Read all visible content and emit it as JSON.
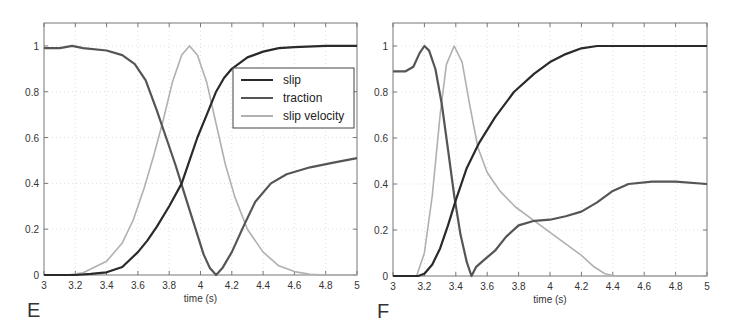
{
  "chart_data": [
    {
      "type": "line",
      "panel_label": "E",
      "xlabel": "time (s)",
      "ylabel": "",
      "xlim": [
        3,
        5
      ],
      "ylim": [
        0,
        1.1
      ],
      "xticks": [
        3,
        3.2,
        3.4,
        3.6,
        3.8,
        4,
        4.2,
        4.4,
        4.6,
        4.8,
        5
      ],
      "xtick_labels": [
        "3",
        "3.2",
        "3.4",
        "3.6",
        "3.8",
        "4",
        "4.2",
        "4.4",
        "4.6",
        "4.8",
        "5"
      ],
      "yticks": [
        0,
        0.2,
        0.4,
        0.6,
        0.8,
        1
      ],
      "ytick_labels": [
        "0",
        "0.2",
        "0.4",
        "0.6",
        "0.8",
        "1"
      ],
      "grid": true,
      "legend": {
        "position": "upper right",
        "entries": [
          "slip",
          "traction",
          "slip velocity"
        ]
      },
      "series": [
        {
          "name": "slip",
          "color": "#2a2a2a",
          "x": [
            3.0,
            3.2,
            3.3,
            3.4,
            3.5,
            3.6,
            3.66,
            3.72,
            3.8,
            3.88,
            3.94,
            3.98,
            4.04,
            4.1,
            4.15,
            4.2,
            4.3,
            4.4,
            4.5,
            4.6,
            4.8,
            5.0
          ],
          "y": [
            0,
            0,
            0.005,
            0.012,
            0.035,
            0.1,
            0.15,
            0.21,
            0.3,
            0.4,
            0.52,
            0.6,
            0.7,
            0.8,
            0.86,
            0.9,
            0.95,
            0.975,
            0.99,
            0.995,
            1.0,
            1.0
          ]
        },
        {
          "name": "traction",
          "color": "#555555",
          "x": [
            3.0,
            3.1,
            3.18,
            3.25,
            3.4,
            3.5,
            3.58,
            3.65,
            3.72,
            3.78,
            3.84,
            3.9,
            3.96,
            4.02,
            4.06,
            4.1,
            4.14,
            4.2,
            4.28,
            4.35,
            4.45,
            4.55,
            4.7,
            4.85,
            5.0
          ],
          "y": [
            0.99,
            0.99,
            1.0,
            0.99,
            0.98,
            0.96,
            0.92,
            0.85,
            0.72,
            0.6,
            0.48,
            0.35,
            0.22,
            0.09,
            0.03,
            0.0,
            0.03,
            0.1,
            0.22,
            0.32,
            0.4,
            0.44,
            0.47,
            0.49,
            0.51
          ]
        },
        {
          "name": "slip velocity",
          "color": "#b0b0b0",
          "x": [
            3.0,
            3.15,
            3.25,
            3.4,
            3.5,
            3.57,
            3.64,
            3.7,
            3.76,
            3.82,
            3.88,
            3.93,
            3.98,
            4.04,
            4.1,
            4.16,
            4.22,
            4.3,
            4.4,
            4.5,
            4.6,
            4.7,
            4.8,
            5.0
          ],
          "y": [
            0,
            0,
            0.01,
            0.06,
            0.14,
            0.24,
            0.38,
            0.52,
            0.67,
            0.84,
            0.96,
            1.0,
            0.96,
            0.84,
            0.66,
            0.48,
            0.34,
            0.2,
            0.1,
            0.04,
            0.015,
            0.003,
            0,
            0
          ]
        }
      ]
    },
    {
      "type": "line",
      "panel_label": "F",
      "xlabel": "time (s)",
      "ylabel": "",
      "xlim": [
        3,
        5
      ],
      "ylim": [
        0,
        1.1
      ],
      "xticks": [
        3,
        3.2,
        3.4,
        3.6,
        3.8,
        4,
        4.2,
        4.4,
        4.6,
        4.8,
        5
      ],
      "xtick_labels": [
        "3",
        "3.2",
        "3.4",
        "3.6",
        "3.8",
        "4",
        "4.2",
        "4.4",
        "4.6",
        "4.8",
        "5"
      ],
      "yticks": [
        0,
        0.2,
        0.4,
        0.6,
        0.8,
        1
      ],
      "ytick_labels": [
        "0",
        "0.2",
        "0.4",
        "0.6",
        "0.8",
        "1"
      ],
      "grid": true,
      "series": [
        {
          "name": "slip",
          "color": "#2a2a2a",
          "x": [
            3.0,
            3.16,
            3.2,
            3.25,
            3.3,
            3.35,
            3.4,
            3.47,
            3.55,
            3.65,
            3.77,
            3.9,
            4.0,
            4.1,
            4.2,
            4.3,
            4.4,
            4.6,
            4.8,
            5.0
          ],
          "y": [
            0,
            0,
            0.01,
            0.05,
            0.12,
            0.22,
            0.33,
            0.47,
            0.58,
            0.69,
            0.8,
            0.88,
            0.93,
            0.965,
            0.99,
            1.0,
            1.0,
            1.0,
            1.0,
            1.0
          ]
        },
        {
          "name": "traction",
          "color": "#555555",
          "x": [
            3.0,
            3.08,
            3.13,
            3.17,
            3.2,
            3.23,
            3.27,
            3.31,
            3.35,
            3.39,
            3.43,
            3.47,
            3.5,
            3.53,
            3.58,
            3.65,
            3.72,
            3.8,
            3.9,
            4.0,
            4.1,
            4.2,
            4.3,
            4.4,
            4.5,
            4.65,
            4.8,
            5.0
          ],
          "y": [
            0.89,
            0.89,
            0.91,
            0.97,
            1.0,
            0.98,
            0.9,
            0.75,
            0.55,
            0.35,
            0.18,
            0.06,
            0.0,
            0.04,
            0.07,
            0.11,
            0.17,
            0.22,
            0.24,
            0.245,
            0.26,
            0.28,
            0.32,
            0.37,
            0.4,
            0.41,
            0.41,
            0.4
          ]
        },
        {
          "name": "slip velocity",
          "color": "#b0b0b0",
          "x": [
            3.0,
            3.15,
            3.2,
            3.25,
            3.3,
            3.34,
            3.39,
            3.44,
            3.49,
            3.54,
            3.6,
            3.68,
            3.78,
            3.9,
            4.0,
            4.1,
            4.2,
            4.28,
            4.35,
            4.42,
            4.5,
            5.0
          ],
          "y": [
            0,
            0,
            0.1,
            0.35,
            0.7,
            0.92,
            1.0,
            0.93,
            0.74,
            0.56,
            0.45,
            0.37,
            0.3,
            0.24,
            0.19,
            0.14,
            0.09,
            0.04,
            0.01,
            0,
            0,
            0
          ]
        }
      ]
    }
  ]
}
